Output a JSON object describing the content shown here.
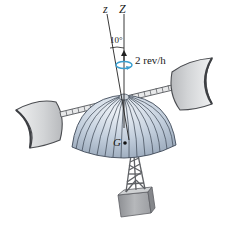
{
  "figure": {
    "axis_labels": {
      "body_axis": "z",
      "vertical_axis": "Z"
    },
    "angle_label": "10°",
    "rotation_label": "2 rev/h",
    "center_of_mass_label": "G",
    "components": [
      "wind-cup-left",
      "wind-cup-right",
      "horizontal-arm",
      "dome",
      "tower",
      "base-block"
    ],
    "colors": {
      "cup_fill": "#d4d6d8",
      "cup_edge": "#4a4c50",
      "dome_fill": "#b9c6d6",
      "dome_highlight": "#e6ecf3",
      "tower": "#6c6e72",
      "base": "#a5a7aa",
      "rotation_arrow": "#3a9fd0",
      "axis_line": "#222222"
    }
  }
}
